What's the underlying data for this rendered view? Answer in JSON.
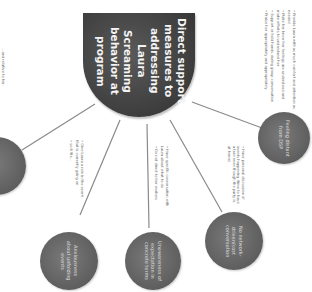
{
  "diagram": {
    "type": "mind-map",
    "orientation": "rotated-90",
    "colors": {
      "center_fill": "#3b3b3b",
      "node_fill": "#5e5e5e",
      "line": "#8a8a8a",
      "text_light": "#f4f4f4",
      "bullet_text": "#6a6a6a",
      "background": "#ffffff"
    },
    "center": {
      "label": "Direct support measures to addressing Laura Screaming behavior at program"
    },
    "left_edge_note": {
      "text": "...and relative to her."
    },
    "nodes": [
      {
        "id": "left",
        "label": "",
        "bullets": [
          "Give Laura a role in the event that is currently going on",
          "so it fits..."
        ]
      },
      {
        "id": "anxiousness",
        "label": "Anxiousness about unfolding events",
        "bullets": []
      },
      {
        "id": "unawareness",
        "label": "Unawareness of expectation in concrete terms",
        "bullets": [
          "Have specific conversation with Laura about what to do",
          "Do not direct to her workers"
        ]
      },
      {
        "id": "no-network",
        "label": "No network-driven/cost conversation",
        "bullets": [
          "Have personal discussion of events happening (time to have a turn even though the party is at home)"
        ]
      },
      {
        "id": "feeling-distant",
        "label": "Feeling distant from DSP",
        "bullets": [
          "Provide Laura with as much comfort and attention as needed",
          "Make her know her feelings are understood and make efforts to understand her",
          "Support or hold hands during group conversation",
          "Praise her appropriately and appropriately"
        ]
      }
    ]
  }
}
